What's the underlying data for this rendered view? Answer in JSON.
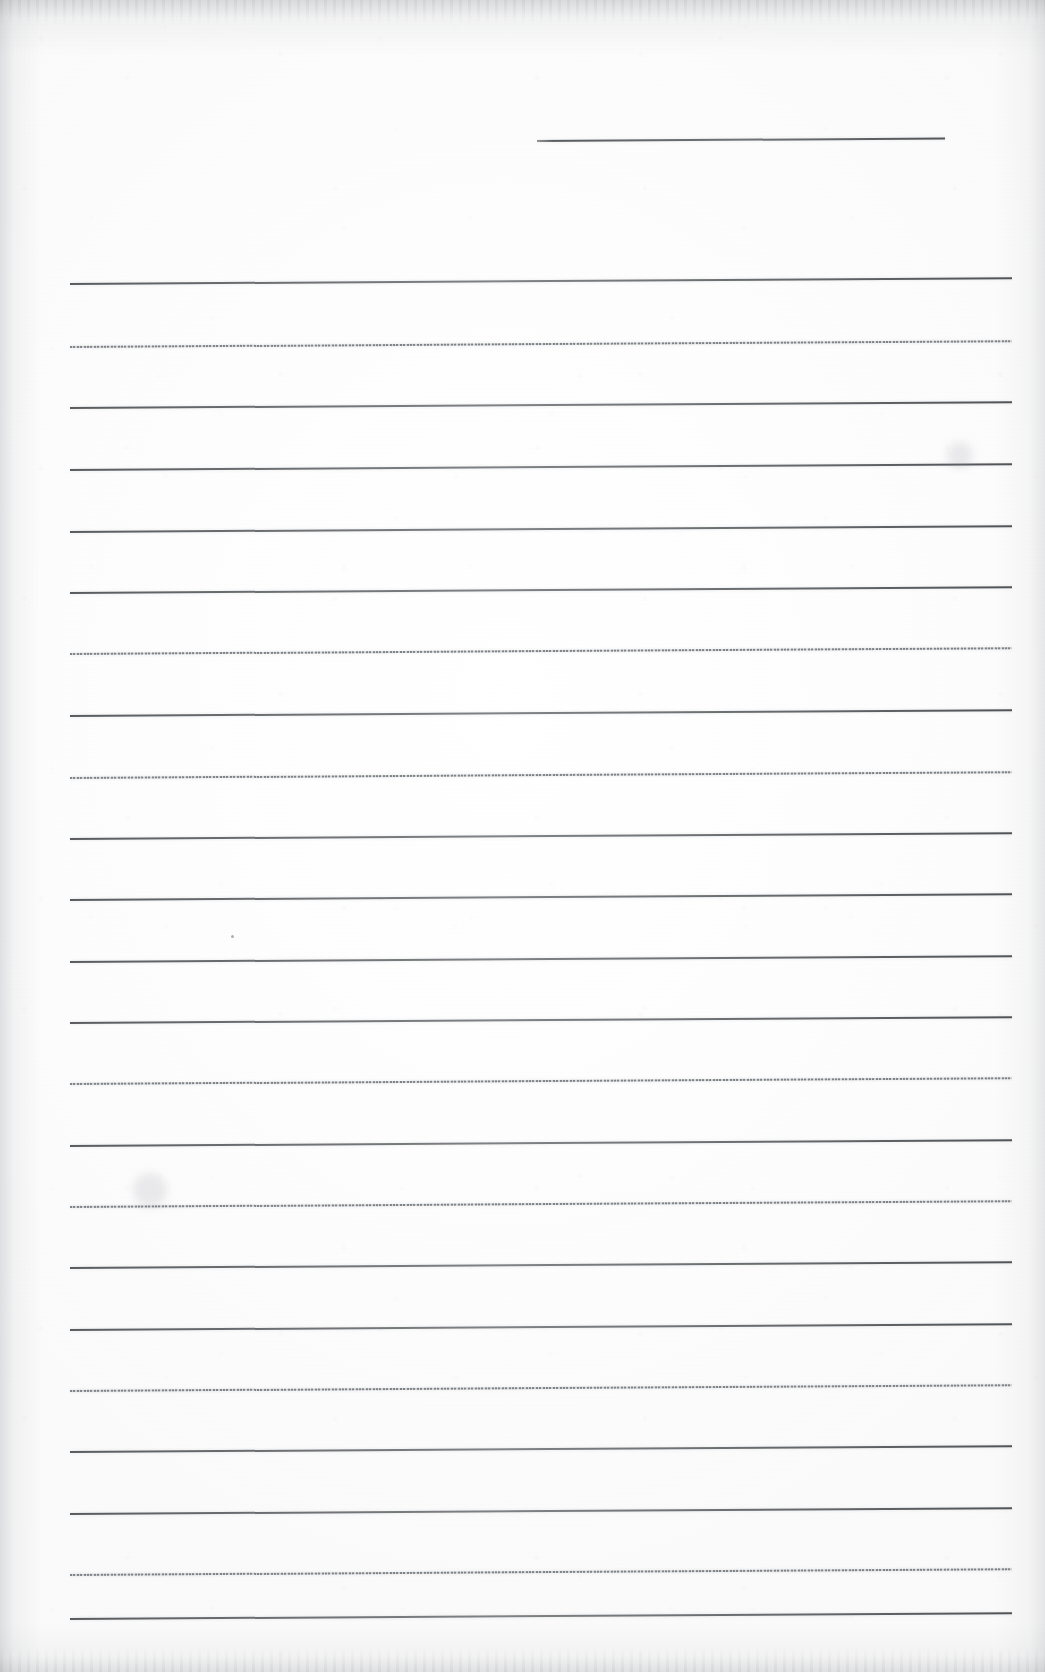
{
  "document": {
    "kind": "scanned-ruled-notebook-page",
    "title": "Blank lined notebook page",
    "page_width": 1045,
    "page_height": 1672,
    "body_text": "",
    "handwriting_present": "no",
    "paper_color": "#fdfdfd",
    "rule_color_dark": "#56585c",
    "rule_color_faint": "#8a8d92",
    "edge_shadow_color": "#787c82"
  },
  "ruling": {
    "left_margin_x": 70,
    "right_margin_x": 1012,
    "line_count": 23,
    "average_spacing": 61.5,
    "tilt_degrees": -0.35,
    "header_rule": {
      "y": 140,
      "x_start": 537,
      "x_end": 945,
      "style": "dark"
    },
    "lines": [
      {
        "y": 283,
        "style": "dark"
      },
      {
        "y": 346,
        "style": "faint"
      },
      {
        "y": 407,
        "style": "dark"
      },
      {
        "y": 469,
        "style": "dark"
      },
      {
        "y": 531,
        "style": "dark"
      },
      {
        "y": 592,
        "style": "dark"
      },
      {
        "y": 653,
        "style": "faint"
      },
      {
        "y": 715,
        "style": "dark"
      },
      {
        "y": 777,
        "style": "faint"
      },
      {
        "y": 838,
        "style": "dark"
      },
      {
        "y": 899,
        "style": "dark"
      },
      {
        "y": 961,
        "style": "dark"
      },
      {
        "y": 1022,
        "style": "dark"
      },
      {
        "y": 1083,
        "style": "faint"
      },
      {
        "y": 1145,
        "style": "dark"
      },
      {
        "y": 1206,
        "style": "faint"
      },
      {
        "y": 1267,
        "style": "dark"
      },
      {
        "y": 1329,
        "style": "dark"
      },
      {
        "y": 1390,
        "style": "faint"
      },
      {
        "y": 1451,
        "style": "dark"
      },
      {
        "y": 1513,
        "style": "dark"
      },
      {
        "y": 1574,
        "style": "faint"
      },
      {
        "y": 1618,
        "style": "dark"
      }
    ]
  },
  "marks": [
    {
      "name": "ink-speck",
      "x": 232,
      "y": 936,
      "size": 3
    },
    {
      "name": "paper-smudge",
      "x": 960,
      "y": 455,
      "size": 26
    },
    {
      "name": "paper-smudge",
      "x": 150,
      "y": 1190,
      "size": 34
    }
  ]
}
